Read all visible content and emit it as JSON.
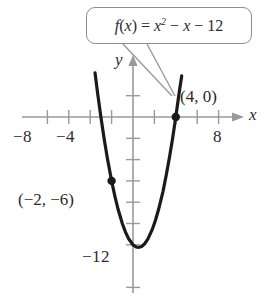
{
  "figure": {
    "callout": {
      "name": "function-equation-callout",
      "text": "f(x) = x² − x − 12"
    },
    "axis_labels": {
      "x": "x",
      "y": "y"
    },
    "x_tick_labels": [
      {
        "value": -8,
        "text": "−8"
      },
      {
        "value": -4,
        "text": "−4"
      },
      {
        "value": 8,
        "text": "8"
      }
    ],
    "y_tick_labels": [
      {
        "value": -12,
        "text": "−12"
      }
    ],
    "point_labels": [
      {
        "text": "(4, 0)",
        "point": [
          4,
          0
        ]
      },
      {
        "text": "(−2, −6)",
        "point": [
          -2,
          -6
        ]
      }
    ]
  },
  "chart_data": {
    "type": "line",
    "title": "",
    "subtitle": "",
    "xlabel": "x",
    "ylabel": "y",
    "function": "f(x) = x^2 - x - 12",
    "equation_display": "f(x) = x² − x − 12",
    "xlim": [
      -9.5,
      9.5
    ],
    "ylim": [
      -15,
      4
    ],
    "grid": false,
    "axes_style": "cartesian-cross-with-arrows",
    "x_ticks_every": 1,
    "y_ticks_every": 2,
    "x_labeled_ticks": [
      -8,
      -4,
      8
    ],
    "y_labeled_ticks": [
      -12
    ],
    "legend": "none",
    "annotations": [
      {
        "label": "(4, 0)",
        "x": 4,
        "y": 0,
        "marker": "filled-circle"
      },
      {
        "label": "(−2, −6)",
        "x": -2,
        "y": -6,
        "marker": "filled-circle"
      },
      {
        "label": "f(x) = x² − x − 12",
        "type": "callout-box",
        "points_to": [
          4,
          0
        ]
      }
    ],
    "roots": [
      -3,
      4
    ],
    "vertex": [
      0.5,
      -12.25
    ],
    "y_intercept": -12,
    "curve_domain": [
      -3.55,
      4.55
    ],
    "series": [
      {
        "name": "f(x) = x² − x − 12",
        "x": [
          -3.55,
          -3.3,
          -3.0,
          -2.7,
          -2.4,
          -2.0,
          -1.7,
          -1.4,
          -1.0,
          -0.7,
          -0.4,
          0.0,
          0.3,
          0.5,
          0.8,
          1.1,
          1.4,
          1.8,
          2.1,
          2.4,
          2.8,
          3.1,
          3.4,
          3.7,
          4.0,
          4.3,
          4.55
        ],
        "y": [
          4.15,
          2.19,
          0.0,
          -2.01,
          -3.84,
          -6.0,
          -7.41,
          -8.64,
          -10.0,
          -10.81,
          -11.44,
          -12.0,
          -12.21,
          -12.25,
          -12.16,
          -11.89,
          -11.44,
          -10.56,
          -9.69,
          -8.64,
          -7.0,
          -5.49,
          -3.84,
          -2.01,
          0.0,
          2.19,
          3.86
        ]
      }
    ]
  }
}
